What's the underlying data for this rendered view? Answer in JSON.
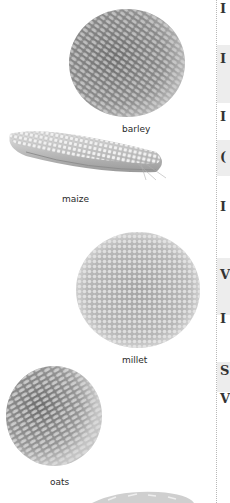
{
  "grains": [
    {
      "name": "barley",
      "label": "barley"
    },
    {
      "name": "maize",
      "label": "maize"
    },
    {
      "name": "millet",
      "label": "millet"
    },
    {
      "name": "oats",
      "label": "oats"
    },
    {
      "name": "rice",
      "label": ""
    }
  ],
  "table": {
    "rows": [
      {
        "initial": "I",
        "shaded": false
      },
      {
        "initial": "I",
        "shaded": true
      },
      {
        "initial": "I",
        "shaded": false
      },
      {
        "initial": "(",
        "shaded": true
      },
      {
        "initial": "I",
        "shaded": false
      },
      {
        "initial": "V",
        "shaded": true
      },
      {
        "initial": "I",
        "shaded": false
      },
      {
        "initial": "S",
        "shaded": true
      },
      {
        "initial": "V",
        "shaded": false
      }
    ]
  },
  "colors": {
    "band": "#ededed",
    "divider": "#b8b8b8",
    "text": "#2a2a2a"
  }
}
